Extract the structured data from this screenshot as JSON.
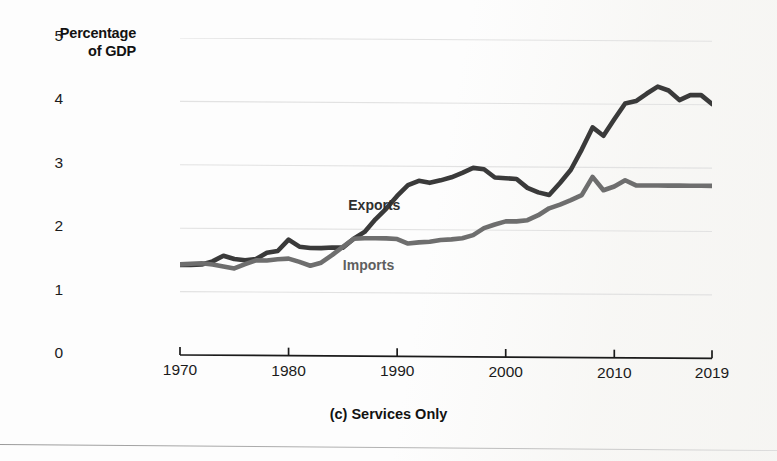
{
  "figure": {
    "y_axis_title_line1": "Percentage",
    "y_axis_title_line2": "of GDP",
    "caption": "(c) Services Only"
  },
  "series_labels": {
    "exports": "Exports",
    "imports": "Imports"
  },
  "colors": {
    "exports_line": "#3a3a3a",
    "imports_line": "#6e6e6e",
    "gridline": "#e2e2e2",
    "axis": "#1b1b1b",
    "background": "#fdfdfd"
  },
  "chart_data": {
    "type": "line",
    "title": "(c) Services Only",
    "xlabel": "",
    "ylabel": "Percentage of GDP",
    "xlim": [
      1970,
      2019
    ],
    "ylim": [
      0,
      5
    ],
    "ytick_labels": [
      "0",
      "1",
      "2",
      "3",
      "4",
      "5"
    ],
    "yticks": [
      0,
      1,
      2,
      3,
      4,
      5
    ],
    "xtick_labels": [
      "1970",
      "1980",
      "1990",
      "2000",
      "2010",
      "2019"
    ],
    "xticks": [
      1970,
      1980,
      1990,
      2000,
      2010,
      2019
    ],
    "grid": "horizontal",
    "legend": "inline-annotations",
    "x": [
      1970,
      1971,
      1972,
      1973,
      1974,
      1975,
      1976,
      1977,
      1978,
      1979,
      1980,
      1981,
      1982,
      1983,
      1984,
      1985,
      1986,
      1987,
      1988,
      1989,
      1990,
      1991,
      1992,
      1993,
      1994,
      1995,
      1996,
      1997,
      1998,
      1999,
      2000,
      2001,
      2002,
      2003,
      2004,
      2005,
      2006,
      2007,
      2008,
      2009,
      2010,
      2011,
      2012,
      2013,
      2014,
      2015,
      2016,
      2017,
      2018,
      2019
    ],
    "series": [
      {
        "name": "Exports",
        "color": "#3a3a3a",
        "values": [
          1.42,
          1.42,
          1.43,
          1.48,
          1.57,
          1.52,
          1.5,
          1.52,
          1.62,
          1.65,
          1.83,
          1.72,
          1.7,
          1.7,
          1.71,
          1.71,
          1.85,
          1.96,
          2.16,
          2.33,
          2.53,
          2.7,
          2.77,
          2.74,
          2.78,
          2.83,
          2.9,
          2.98,
          2.96,
          2.83,
          2.82,
          2.81,
          2.67,
          2.6,
          2.56,
          2.75,
          2.96,
          3.28,
          3.63,
          3.5,
          3.76,
          4.01,
          4.05,
          4.17,
          4.28,
          4.22,
          4.07,
          4.15,
          4.15,
          4.01
        ]
      },
      {
        "name": "Imports",
        "color": "#6e6e6e",
        "values": [
          1.43,
          1.44,
          1.45,
          1.43,
          1.4,
          1.37,
          1.44,
          1.5,
          1.5,
          1.52,
          1.53,
          1.48,
          1.42,
          1.47,
          1.59,
          1.72,
          1.85,
          1.86,
          1.86,
          1.86,
          1.85,
          1.78,
          1.8,
          1.81,
          1.84,
          1.85,
          1.87,
          1.92,
          2.03,
          2.09,
          2.14,
          2.14,
          2.16,
          2.24,
          2.35,
          2.41,
          2.48,
          2.56,
          2.85,
          2.64,
          2.7,
          2.8,
          2.72,
          2.72,
          2.72,
          2.72,
          2.72,
          2.72,
          2.72,
          2.72
        ]
      }
    ]
  }
}
